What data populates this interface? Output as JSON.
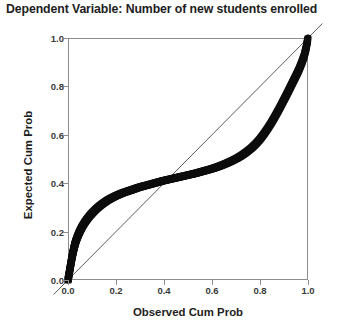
{
  "chart_data": {
    "type": "line",
    "title": "Dependent Variable: Number of new students enrolled",
    "xlabel": "Observed Cum Prob",
    "ylabel": "Expected Cum Prob",
    "xlim": [
      0.0,
      1.0
    ],
    "ylim": [
      0.0,
      1.0
    ],
    "grid": false,
    "legend": "none",
    "xticks": [
      "0.0",
      "0.2",
      "0.4",
      "0.6",
      "0.8",
      "1.0"
    ],
    "xtick_values": [
      0.0,
      0.2,
      0.4,
      0.6,
      0.8,
      1.0
    ],
    "yticks": [
      "0.0",
      "0.2",
      "0.4",
      "0.6",
      "0.8",
      "1.0"
    ],
    "ytick_values": [
      0.0,
      0.2,
      0.4,
      0.6,
      0.8,
      1.0
    ],
    "series": [
      {
        "name": "Observed vs Expected cumulative probability",
        "style": "dense-markers",
        "color": "#0d0d0d",
        "x": [
          0.0,
          0.004,
          0.008,
          0.012,
          0.016,
          0.02,
          0.024,
          0.028,
          0.032,
          0.038,
          0.045,
          0.052,
          0.06,
          0.07,
          0.08,
          0.092,
          0.104,
          0.118,
          0.132,
          0.148,
          0.164,
          0.18,
          0.198,
          0.216,
          0.234,
          0.252,
          0.27,
          0.29,
          0.31,
          0.33,
          0.352,
          0.374,
          0.396,
          0.418,
          0.44,
          0.462,
          0.484,
          0.506,
          0.528,
          0.55,
          0.572,
          0.594,
          0.616,
          0.638,
          0.66,
          0.682,
          0.704,
          0.724,
          0.744,
          0.764,
          0.782,
          0.8,
          0.816,
          0.832,
          0.848,
          0.862,
          0.876,
          0.89,
          0.903,
          0.916,
          0.928,
          0.94,
          0.952,
          0.963,
          0.974,
          0.984,
          0.992,
          1.0
        ],
        "y": [
          0.0,
          0.022,
          0.045,
          0.068,
          0.09,
          0.11,
          0.128,
          0.144,
          0.158,
          0.175,
          0.192,
          0.207,
          0.222,
          0.238,
          0.252,
          0.267,
          0.28,
          0.294,
          0.306,
          0.318,
          0.329,
          0.338,
          0.347,
          0.355,
          0.362,
          0.368,
          0.374,
          0.381,
          0.387,
          0.392,
          0.398,
          0.404,
          0.41,
          0.415,
          0.42,
          0.425,
          0.43,
          0.435,
          0.44,
          0.446,
          0.452,
          0.458,
          0.465,
          0.473,
          0.482,
          0.492,
          0.503,
          0.515,
          0.529,
          0.545,
          0.562,
          0.582,
          0.603,
          0.626,
          0.651,
          0.675,
          0.7,
          0.726,
          0.751,
          0.776,
          0.8,
          0.824,
          0.848,
          0.871,
          0.898,
          0.926,
          0.958,
          1.0
        ]
      },
      {
        "name": "Reference diagonal",
        "style": "thin-line",
        "color": "#4a4a4a",
        "x": [
          0.0,
          1.0
        ],
        "y": [
          0.0,
          1.0
        ]
      }
    ],
    "annotations": [
      "Curve crosses the reference diagonal near (0.28, 0.38)",
      "Plateau of expected probability near 0.40 between observed 0.30 and 0.70"
    ]
  }
}
